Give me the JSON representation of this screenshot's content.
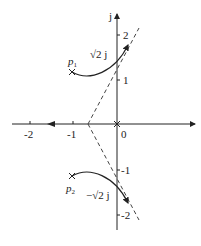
{
  "diagram": {
    "type": "root-locus",
    "axes": {
      "imag_label": "j",
      "x_ticks": [
        "-2",
        "-1",
        "0"
      ],
      "y_ticks_pos": [
        "2",
        "1"
      ],
      "y_ticks_neg": [
        "-1",
        "-2"
      ]
    },
    "poles": [
      {
        "name": "p",
        "sub": "1",
        "re": -1,
        "im": 1
      },
      {
        "name": "p",
        "sub": "2",
        "re": -1,
        "im": -1
      },
      {
        "name": "",
        "sub": "",
        "re": 0,
        "im": 0
      }
    ],
    "annotations": {
      "upper_crossing": "√2 j",
      "lower_crossing": "−√2 j"
    },
    "asymptotes": {
      "centroid": -0.67,
      "angles_deg": [
        60,
        -60,
        180
      ]
    },
    "colors": {
      "line": "#222222",
      "dash": "#444444",
      "background": "#ffffff"
    }
  }
}
